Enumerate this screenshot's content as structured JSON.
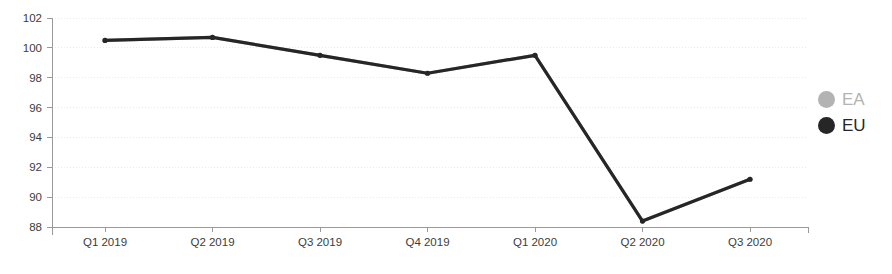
{
  "chart_data": {
    "type": "line",
    "title": "",
    "subtitle": "",
    "xlabel": "",
    "ylabel": "",
    "categories": [
      "Q1 2019",
      "Q2 2019",
      "Q3 2019",
      "Q4 2019",
      "Q1 2020",
      "Q2 2020",
      "Q3 2020"
    ],
    "series": [
      {
        "name": "EA",
        "color": "#b3b3b3",
        "values": [
          100.5,
          100.7,
          99.5,
          98.3,
          99.5,
          88.4,
          91.2
        ]
      },
      {
        "name": "EU",
        "color": "#262626",
        "values": [
          100.5,
          100.7,
          99.5,
          98.3,
          99.5,
          88.4,
          91.2
        ]
      }
    ],
    "ylim": [
      88,
      102
    ],
    "yticks": [
      88,
      90,
      92,
      94,
      96,
      98,
      100,
      102
    ],
    "ytick_labels": [
      "88",
      "90",
      "92",
      "94",
      "96",
      "98",
      "100",
      "102"
    ],
    "grid": true,
    "legend_position": "right"
  },
  "legend": {
    "items": [
      {
        "label": "EA",
        "color": "#b3b3b3",
        "text_color": "#b3b3b3"
      },
      {
        "label": "EU",
        "color": "#262626",
        "text_color": "#262626"
      }
    ]
  },
  "axes": {
    "y_axis_name": "y-axis",
    "x_axis_name": "x-axis"
  },
  "colors": {
    "background": "#ffffff",
    "gridline": "#e9e9ef",
    "axis": "#9a9a9a",
    "tick_text": "#3c3c3c"
  }
}
